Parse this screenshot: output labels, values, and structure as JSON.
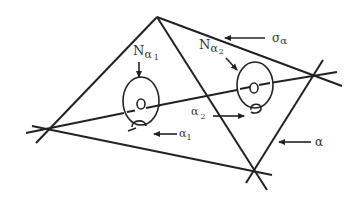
{
  "figure": {
    "colors": {
      "stroke": "#222222",
      "text": "#333333",
      "background": "#ffffff"
    }
  },
  "labels": {
    "N_alpha1": {
      "base": "N",
      "sub": "α",
      "subsub": "1"
    },
    "N_alpha2": {
      "base": "N",
      "sub": "α",
      "subsub": "2"
    },
    "sigma_alpha": {
      "base": "σ",
      "sub": "α"
    },
    "alpha1": {
      "base": "α",
      "sub": "1"
    },
    "alpha2": {
      "base": "α",
      "sub": "2"
    },
    "alpha": {
      "base": "α"
    }
  }
}
